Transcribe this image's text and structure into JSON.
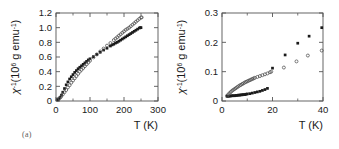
{
  "figure": {
    "background": "#ffffff",
    "axis_color": "#555555",
    "marker_filled_color": "#1a1a1a",
    "marker_open_color": "#4d4d4d"
  },
  "panels": [
    {
      "id": "a",
      "sublabel": "(a)",
      "xlabel": "T (K)",
      "ylabel_main": "χ",
      "ylabel_exp": "-1",
      "ylabel_rest_a": "(10",
      "ylabel_rest_exp": "6",
      "ylabel_rest_b": " g emu",
      "ylabel_rest_exp2": "-1",
      "ylabel_rest_c": ")",
      "xticks": [
        "0",
        "100",
        "200",
        "300"
      ],
      "xtick_values": [
        0,
        100,
        200,
        300
      ],
      "xminor_values": [
        50,
        150,
        250
      ],
      "yticks": [
        "0",
        "0.2",
        "0.4",
        "0.6",
        "0.8",
        "1.0",
        "1.2"
      ],
      "ytick_values": [
        0,
        0.2,
        0.4,
        0.6,
        0.8,
        1.0,
        1.2
      ]
    },
    {
      "id": "b",
      "sublabel": "(b)",
      "xlabel": "T (K)",
      "ylabel_main": "χ",
      "ylabel_exp": "-1",
      "ylabel_rest_a": "(10",
      "ylabel_rest_exp": "6",
      "ylabel_rest_b": " g emu",
      "ylabel_rest_exp2": "-1",
      "ylabel_rest_c": ")",
      "xticks": [
        "0",
        "20",
        "40"
      ],
      "xtick_values": [
        0,
        20,
        40
      ],
      "xminor_values": [
        10,
        30
      ],
      "yticks": [
        "0",
        "0.1",
        "0.2",
        "0.3"
      ],
      "ytick_values": [
        0,
        0.1,
        0.2,
        0.3
      ]
    }
  ],
  "chart_data": [
    {
      "type": "scatter",
      "panel": "a",
      "title": "",
      "xlabel": "T (K)",
      "ylabel": "χ⁻¹ (10⁶ g emu⁻¹)",
      "xlim": [
        0,
        300
      ],
      "ylim": [
        0,
        1.2
      ],
      "grid": false,
      "legend": "none",
      "series": [
        {
          "name": "filled-squares",
          "marker": "filled-square",
          "x": [
            5,
            8,
            12,
            16,
            20,
            25,
            30,
            35,
            40,
            45,
            50,
            55,
            60,
            65,
            70,
            75,
            80,
            85,
            90,
            95,
            100,
            110,
            120,
            130,
            140,
            150,
            160,
            165,
            170,
            175,
            180,
            185,
            190,
            195,
            200,
            205,
            210,
            215,
            220,
            225,
            230,
            235,
            240,
            245,
            248,
            250
          ],
          "y": [
            0.02,
            0.03,
            0.05,
            0.08,
            0.12,
            0.17,
            0.22,
            0.26,
            0.3,
            0.33,
            0.36,
            0.39,
            0.415,
            0.44,
            0.46,
            0.48,
            0.5,
            0.52,
            0.54,
            0.56,
            0.575,
            0.605,
            0.635,
            0.665,
            0.695,
            0.72,
            0.75,
            0.765,
            0.775,
            0.79,
            0.8,
            0.815,
            0.83,
            0.845,
            0.86,
            0.875,
            0.89,
            0.905,
            0.92,
            0.935,
            0.95,
            0.965,
            0.98,
            0.995,
            1.0,
            1.0
          ]
        },
        {
          "name": "open-circles",
          "marker": "open-circle",
          "x": [
            5,
            10,
            15,
            20,
            25,
            30,
            35,
            40,
            45,
            50,
            55,
            60,
            65,
            70,
            75,
            80,
            85,
            90,
            95,
            100,
            110,
            120,
            130,
            140,
            150,
            160,
            170,
            175,
            180,
            185,
            190,
            195,
            200,
            205,
            210,
            215,
            220,
            225,
            230,
            235,
            240,
            245,
            250,
            252
          ],
          "y": [
            0.015,
            0.035,
            0.06,
            0.09,
            0.12,
            0.15,
            0.185,
            0.215,
            0.25,
            0.28,
            0.31,
            0.34,
            0.37,
            0.4,
            0.425,
            0.45,
            0.475,
            0.5,
            0.525,
            0.55,
            0.595,
            0.635,
            0.675,
            0.715,
            0.755,
            0.79,
            0.83,
            0.85,
            0.87,
            0.89,
            0.91,
            0.93,
            0.95,
            0.97,
            0.985,
            1.0,
            1.02,
            1.04,
            1.06,
            1.08,
            1.1,
            1.12,
            1.14,
            1.14
          ]
        }
      ]
    },
    {
      "type": "scatter",
      "panel": "b",
      "title": "",
      "xlabel": "T (K)",
      "ylabel": "χ⁻¹ (10⁶ g emu⁻¹)",
      "xlim": [
        0,
        40
      ],
      "ylim": [
        0,
        0.3
      ],
      "grid": false,
      "legend": "none",
      "series": [
        {
          "name": "filled-squares",
          "marker": "filled-square",
          "x": [
            2.0,
            2.5,
            3.0,
            3.5,
            4.0,
            4.5,
            5.0,
            5.5,
            6.0,
            6.5,
            7.0,
            7.5,
            8.0,
            8.5,
            9.0,
            9.5,
            10.0,
            11.0,
            12.0,
            13.0,
            14.0,
            15.0,
            16.0,
            17.0,
            18.0,
            20.0,
            25.0,
            30.0,
            34.5,
            39.5
          ],
          "y": [
            0.016,
            0.016,
            0.017,
            0.017,
            0.018,
            0.018,
            0.018,
            0.019,
            0.019,
            0.02,
            0.02,
            0.021,
            0.021,
            0.022,
            0.022,
            0.023,
            0.024,
            0.025,
            0.027,
            0.029,
            0.031,
            0.033,
            0.036,
            0.039,
            0.043,
            0.112,
            0.157,
            0.197,
            0.221,
            0.25
          ]
        },
        {
          "name": "open-circles",
          "marker": "open-circle",
          "x": [
            2.0,
            2.5,
            3.0,
            3.5,
            4.0,
            4.5,
            5.0,
            5.5,
            6.0,
            6.5,
            7.0,
            7.5,
            8.0,
            8.5,
            9.0,
            9.5,
            10.0,
            10.5,
            11.0,
            11.5,
            12.0,
            12.5,
            13.0,
            14.0,
            15.0,
            16.0,
            17.0,
            18.0,
            19.0,
            19.5,
            24.5,
            29.5,
            34.0,
            39.5
          ],
          "y": [
            0.018,
            0.022,
            0.027,
            0.031,
            0.035,
            0.038,
            0.041,
            0.044,
            0.047,
            0.05,
            0.053,
            0.055,
            0.058,
            0.06,
            0.063,
            0.065,
            0.067,
            0.069,
            0.071,
            0.073,
            0.075,
            0.077,
            0.079,
            0.082,
            0.085,
            0.088,
            0.091,
            0.094,
            0.098,
            0.1,
            0.114,
            0.135,
            0.155,
            0.172
          ]
        }
      ]
    }
  ]
}
